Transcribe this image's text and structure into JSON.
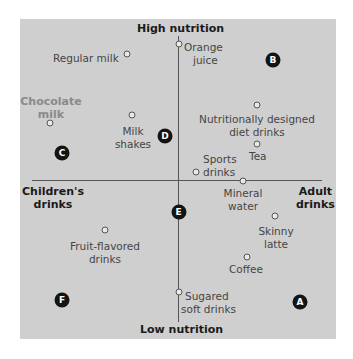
{
  "axes": {
    "top": "High nutrition",
    "bottom": "Low nutrition",
    "left": [
      "Children's",
      "drinks"
    ],
    "right": [
      "Adult",
      "drinks"
    ]
  },
  "products": [
    {
      "name": "Regular milk",
      "lines": [
        "Regular milk"
      ]
    },
    {
      "name": "Orange juice",
      "lines": [
        "Orange",
        "juice"
      ]
    },
    {
      "name": "Chocolate milk",
      "lines": [
        "Chocolate",
        "milk"
      ]
    },
    {
      "name": "Milk shakes",
      "lines": [
        "Milk",
        "shakes"
      ]
    },
    {
      "name": "Nutritionally designed diet drinks",
      "lines": [
        "Nutritionally designed",
        "diet drinks"
      ]
    },
    {
      "name": "Tea",
      "lines": [
        "Tea"
      ]
    },
    {
      "name": "Sports drinks",
      "lines": [
        "Sports",
        "drinks"
      ]
    },
    {
      "name": "Mineral water",
      "lines": [
        "Mineral",
        "water"
      ]
    },
    {
      "name": "Skinny latte",
      "lines": [
        "Skinny",
        "latte"
      ]
    },
    {
      "name": "Fruit-flavored drinks",
      "lines": [
        "Fruit-flavored",
        "drinks"
      ]
    },
    {
      "name": "Coffee",
      "lines": [
        "Coffee"
      ]
    },
    {
      "name": "Sugared soft drinks",
      "lines": [
        "Sugared",
        "soft drinks"
      ]
    }
  ],
  "segments": [
    "A",
    "B",
    "C",
    "D",
    "E",
    "F"
  ],
  "colors": {
    "panel": "#cfcfcf",
    "axis": "#555555",
    "label": "#454545",
    "highlight_label": "#8a8a8a",
    "badge": "#141414"
  }
}
